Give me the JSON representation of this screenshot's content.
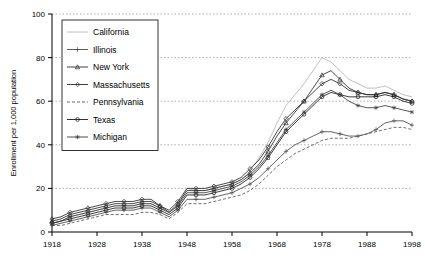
{
  "chart_data": {
    "type": "line",
    "title": "",
    "xlabel": "",
    "ylabel": "Enrollment per 1,000 population",
    "xlim": [
      1918,
      1998
    ],
    "ylim": [
      0,
      100
    ],
    "xticks": [
      1918,
      1928,
      1938,
      1948,
      1958,
      1968,
      1978,
      1988,
      1998
    ],
    "yticks": [
      0,
      20,
      40,
      60,
      80,
      100
    ],
    "grid": true,
    "legend_position": "top-left",
    "x": [
      1918,
      1920,
      1922,
      1924,
      1926,
      1928,
      1930,
      1932,
      1934,
      1936,
      1938,
      1940,
      1942,
      1944,
      1946,
      1948,
      1950,
      1952,
      1954,
      1956,
      1958,
      1960,
      1962,
      1964,
      1966,
      1968,
      1970,
      1972,
      1974,
      1976,
      1978,
      1980,
      1982,
      1984,
      1986,
      1988,
      1990,
      1992,
      1994,
      1996,
      1998
    ],
    "series": [
      {
        "name": "California",
        "marker": "none",
        "values": [
          4,
          5,
          7,
          8,
          9,
          10,
          11,
          12,
          12,
          12,
          13,
          13,
          11,
          9,
          12,
          20,
          19,
          19,
          20,
          21,
          22,
          24,
          28,
          34,
          41,
          50,
          58,
          63,
          68,
          74,
          80,
          78,
          74,
          70,
          68,
          66,
          66,
          67,
          65,
          63,
          62
        ]
      },
      {
        "name": "Illinois",
        "marker": "plus",
        "values": [
          3,
          4,
          5,
          6,
          7,
          8,
          9,
          10,
          10,
          10,
          11,
          11,
          9,
          7,
          10,
          15,
          15,
          15,
          16,
          17,
          18,
          20,
          22,
          25,
          29,
          33,
          37,
          40,
          42,
          44,
          46,
          46,
          45,
          44,
          44,
          45,
          47,
          50,
          51,
          51,
          49
        ]
      },
      {
        "name": "New York",
        "marker": "triangle",
        "values": [
          5,
          6,
          8,
          9,
          10,
          11,
          12,
          13,
          13,
          13,
          14,
          14,
          12,
          9,
          13,
          19,
          19,
          19,
          20,
          21,
          22,
          24,
          27,
          31,
          37,
          44,
          50,
          55,
          60,
          66,
          72,
          74,
          70,
          66,
          64,
          63,
          63,
          64,
          63,
          61,
          60
        ]
      },
      {
        "name": "Massachusetts",
        "marker": "diamond",
        "values": [
          6,
          7,
          9,
          10,
          11,
          12,
          13,
          14,
          14,
          14,
          15,
          15,
          12,
          10,
          14,
          20,
          20,
          20,
          21,
          22,
          23,
          25,
          29,
          33,
          39,
          46,
          52,
          56,
          60,
          64,
          68,
          70,
          68,
          65,
          64,
          63,
          63,
          64,
          63,
          61,
          60
        ]
      },
      {
        "name": "Pennsylvania",
        "marker": "dashed",
        "values": [
          3,
          3,
          4,
          5,
          6,
          7,
          8,
          8,
          8,
          8,
          9,
          9,
          8,
          6,
          9,
          13,
          13,
          13,
          14,
          15,
          16,
          17,
          19,
          22,
          26,
          30,
          33,
          36,
          38,
          40,
          42,
          43,
          43,
          43,
          44,
          45,
          46,
          47,
          48,
          48,
          47
        ]
      },
      {
        "name": "Texas",
        "marker": "circle",
        "values": [
          4,
          5,
          6,
          7,
          8,
          9,
          10,
          11,
          11,
          11,
          12,
          12,
          10,
          8,
          11,
          17,
          17,
          17,
          18,
          19,
          20,
          22,
          25,
          29,
          34,
          40,
          46,
          50,
          54,
          58,
          62,
          64,
          63,
          62,
          62,
          62,
          62,
          63,
          62,
          60,
          59
        ]
      },
      {
        "name": "Michigan",
        "marker": "star",
        "values": [
          4,
          5,
          7,
          8,
          9,
          10,
          11,
          12,
          12,
          12,
          13,
          13,
          11,
          9,
          12,
          18,
          18,
          18,
          19,
          20,
          21,
          23,
          26,
          30,
          35,
          41,
          47,
          51,
          55,
          59,
          63,
          65,
          63,
          60,
          58,
          57,
          57,
          58,
          57,
          56,
          55
        ]
      }
    ]
  }
}
